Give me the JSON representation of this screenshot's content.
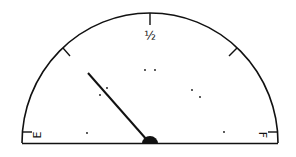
{
  "gauge": {
    "title": "Fuel gauge",
    "labels": {
      "empty": "E",
      "half": "½",
      "full": "F"
    },
    "needle_position": "approximately 1/4 (between E and 1/2)",
    "tick_marks": [
      "E",
      "1/4",
      "1/2",
      "3/4",
      "F"
    ],
    "colors": {
      "stroke": "#111111",
      "background": "#ffffff"
    }
  }
}
